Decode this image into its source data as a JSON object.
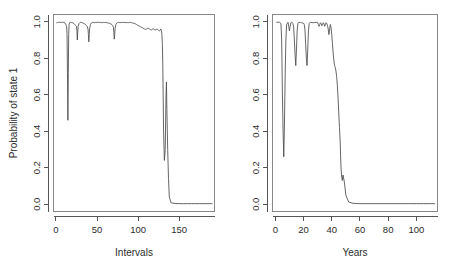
{
  "figure": {
    "title": "",
    "background": "#ffffff",
    "line_color": "#4a4a4a",
    "axis_color": "#555555",
    "box_color": "#888888",
    "panel_count": 2
  },
  "chart_data": [
    {
      "type": "line",
      "panel": "left",
      "title": "",
      "xlabel": "Intervals",
      "ylabel": "Probability of state 1",
      "xlim": [
        -3,
        193
      ],
      "ylim": [
        -0.04,
        1.04
      ],
      "xticks": [
        0,
        50,
        100,
        150
      ],
      "xticklabels": [
        "0",
        "50",
        "100",
        "150"
      ],
      "yticks": [
        0.0,
        0.2,
        0.4,
        0.6,
        0.8,
        1.0
      ],
      "yticklabels": [
        "0.0",
        "0.2",
        "0.4",
        "0.6",
        "0.8",
        "1.0"
      ],
      "grid": false,
      "legend": "none",
      "series": [
        {
          "name": "Probability of state 1",
          "x": [
            1,
            2,
            3,
            4,
            5,
            6,
            7,
            8,
            9,
            10,
            11,
            12,
            13,
            13.5,
            14,
            14.5,
            15,
            15.5,
            16,
            16.5,
            17,
            18,
            19,
            20,
            21,
            22,
            23,
            24,
            25,
            25.5,
            26,
            26.5,
            27,
            28,
            29,
            30,
            31,
            32,
            33,
            34,
            35,
            36,
            37,
            38,
            39,
            39.5,
            40,
            40.5,
            41,
            42,
            43,
            44,
            45,
            46,
            47,
            48,
            49,
            50,
            51,
            52,
            53,
            54,
            55,
            56,
            57,
            58,
            59,
            60,
            61,
            62,
            63,
            64,
            65,
            66,
            67,
            68,
            69,
            70,
            70.5,
            71,
            71.5,
            72,
            73,
            74,
            75,
            76,
            77,
            78,
            79,
            80,
            81,
            82,
            83,
            84,
            85,
            86,
            87,
            88,
            89,
            90,
            91,
            92,
            93,
            94,
            95,
            96,
            97,
            98,
            99,
            100,
            101,
            102,
            103,
            104,
            105,
            106,
            107,
            108,
            109,
            110,
            111,
            112,
            113,
            114,
            115,
            116,
            117,
            118,
            119,
            120,
            121,
            122,
            123,
            124,
            125,
            126,
            127,
            127.5,
            128,
            128.5,
            129,
            129.5,
            130,
            130.5,
            131,
            132,
            133,
            133.5,
            134,
            134.5,
            135,
            136,
            137,
            138,
            140,
            145,
            150,
            155,
            160,
            165,
            170,
            175,
            180,
            185,
            190
          ],
          "y": [
            0.995,
            0.997,
            0.996,
            0.998,
            0.997,
            0.996,
            0.997,
            0.998,
            0.997,
            0.996,
            0.993,
            0.985,
            0.975,
            0.93,
            0.72,
            0.46,
            0.72,
            0.93,
            0.985,
            0.995,
            0.998,
            0.997,
            0.996,
            0.995,
            0.993,
            0.99,
            0.985,
            0.98,
            0.975,
            0.95,
            0.9,
            0.94,
            0.975,
            0.99,
            0.995,
            0.997,
            0.996,
            0.995,
            0.993,
            0.99,
            0.988,
            0.985,
            0.98,
            0.975,
            0.96,
            0.93,
            0.89,
            0.93,
            0.965,
            0.985,
            0.993,
            0.996,
            0.997,
            0.996,
            0.995,
            0.997,
            0.996,
            0.997,
            0.998,
            0.997,
            0.996,
            0.997,
            0.996,
            0.995,
            0.996,
            0.997,
            0.996,
            0.997,
            0.996,
            0.995,
            0.994,
            0.993,
            0.992,
            0.99,
            0.988,
            0.985,
            0.98,
            0.97,
            0.94,
            0.905,
            0.93,
            0.965,
            0.985,
            0.993,
            0.996,
            0.997,
            0.996,
            0.995,
            0.996,
            0.997,
            0.996,
            0.997,
            0.996,
            0.997,
            0.996,
            0.995,
            0.996,
            0.995,
            0.996,
            0.997,
            0.996,
            0.995,
            0.994,
            0.993,
            0.992,
            0.99,
            0.988,
            0.985,
            0.982,
            0.98,
            0.978,
            0.975,
            0.973,
            0.97,
            0.968,
            0.965,
            0.963,
            0.96,
            0.958,
            0.96,
            0.963,
            0.966,
            0.963,
            0.96,
            0.957,
            0.955,
            0.958,
            0.962,
            0.96,
            0.957,
            0.955,
            0.958,
            0.96,
            0.957,
            0.953,
            0.95,
            0.955,
            0.96,
            0.955,
            0.95,
            0.93,
            0.88,
            0.78,
            0.6,
            0.4,
            0.24,
            0.3,
            0.45,
            0.6,
            0.67,
            0.52,
            0.3,
            0.14,
            0.04,
            0.008,
            0.004,
            0.003,
            0.003,
            0.003,
            0.003,
            0.003,
            0.003,
            0.003,
            0.003,
            0.003,
            0.003,
            0.003
          ]
        }
      ]
    },
    {
      "type": "line",
      "panel": "right",
      "title": "",
      "xlabel": "Years",
      "ylabel": "",
      "xlim": [
        -2,
        115
      ],
      "ylim": [
        -0.04,
        1.04
      ],
      "xticks": [
        0,
        20,
        40,
        60,
        80,
        100
      ],
      "xticklabels": [
        "0",
        "20",
        "40",
        "60",
        "80",
        "100"
      ],
      "yticks": [
        0.0,
        0.2,
        0.4,
        0.6,
        0.8,
        1.0
      ],
      "yticklabels": [
        "0.0",
        "0.2",
        "0.4",
        "0.6",
        "0.8",
        "1.0"
      ],
      "grid": false,
      "legend": "none",
      "series": [
        {
          "name": "Probability of state 1",
          "x": [
            1,
            2,
            3,
            4,
            4.5,
            5,
            5.5,
            6,
            6.5,
            7,
            7.5,
            8,
            9,
            9.5,
            10,
            10.5,
            11,
            11.5,
            12,
            12.5,
            13,
            13.5,
            14,
            14.5,
            15,
            15.5,
            16,
            16.5,
            17,
            17.5,
            18,
            18.5,
            19,
            19.5,
            20,
            20.5,
            21,
            21.5,
            22,
            22.5,
            23,
            23.5,
            24,
            24.5,
            25,
            26,
            27,
            28,
            29,
            30,
            30.5,
            31,
            31.5,
            32,
            32.5,
            33,
            33.5,
            34,
            34.5,
            35,
            35.5,
            36,
            36.5,
            37,
            37.5,
            38,
            38.5,
            39,
            39.5,
            40,
            40.5,
            41,
            41.5,
            42,
            42.5,
            43,
            43.5,
            44,
            44.5,
            45,
            45.5,
            46,
            46.3,
            46.6,
            47,
            47.5,
            48,
            49,
            50,
            52,
            55,
            60,
            65,
            70,
            75,
            80,
            85,
            90,
            95,
            100,
            105,
            110,
            113
          ],
          "y": [
            0.997,
            0.998,
            0.997,
            0.99,
            0.9,
            0.62,
            0.4,
            0.26,
            0.45,
            0.72,
            0.9,
            0.985,
            0.997,
            0.975,
            0.95,
            0.975,
            0.995,
            0.997,
            0.996,
            0.99,
            0.97,
            0.9,
            0.82,
            0.76,
            0.85,
            0.95,
            0.99,
            0.997,
            0.996,
            0.997,
            0.996,
            0.995,
            0.994,
            0.993,
            0.992,
            0.985,
            0.96,
            0.88,
            0.8,
            0.76,
            0.85,
            0.95,
            0.99,
            0.996,
            0.997,
            0.996,
            0.995,
            0.996,
            0.997,
            0.996,
            0.985,
            0.975,
            0.985,
            0.995,
            0.99,
            0.978,
            0.985,
            0.995,
            0.99,
            0.975,
            0.985,
            0.995,
            0.99,
            0.98,
            0.96,
            0.93,
            0.96,
            0.985,
            0.97,
            0.93,
            0.88,
            0.83,
            0.79,
            0.76,
            0.75,
            0.73,
            0.7,
            0.65,
            0.58,
            0.5,
            0.42,
            0.34,
            0.26,
            0.2,
            0.155,
            0.13,
            0.16,
            0.12,
            0.05,
            0.012,
            0.005,
            0.003,
            0.003,
            0.003,
            0.003,
            0.003,
            0.003,
            0.003,
            0.003,
            0.003,
            0.003,
            0.003,
            0.003,
            0.003
          ]
        }
      ]
    }
  ]
}
